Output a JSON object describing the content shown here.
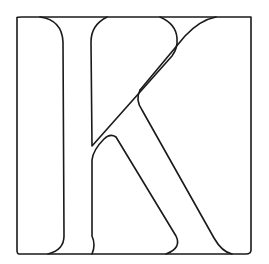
{
  "image": {
    "subject": "Outlined capital letter K inside a square frame",
    "letter": "K",
    "stroke_color": "#1a1a1a",
    "background_color": "#ffffff"
  }
}
